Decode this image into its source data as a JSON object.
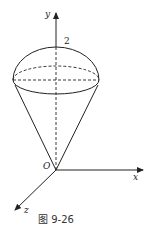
{
  "figure": {
    "caption": "图 9-26",
    "labels": {
      "y_axis": "y",
      "x_axis": "x",
      "z_axis": "z",
      "origin": "O",
      "height_mark": "2"
    }
  }
}
